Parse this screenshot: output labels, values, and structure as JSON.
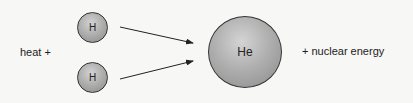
{
  "diagram": {
    "left_label": "heat +",
    "right_label": "+ nuclear energy",
    "reactants": [
      {
        "symbol": "H"
      },
      {
        "symbol": "H"
      }
    ],
    "product": {
      "symbol": "He"
    },
    "colors": {
      "atom_fill": "#b0b0b0",
      "outline": "#333333",
      "arrow": "#222222",
      "background": "#f7f7f5"
    }
  }
}
